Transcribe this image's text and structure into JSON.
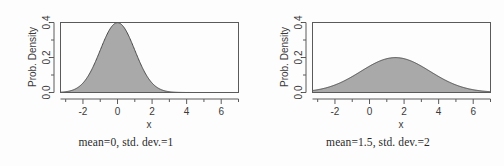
{
  "figure": {
    "background_color": "#fdfdfd",
    "curve_fill_color": "#a9a9a9",
    "curve_line_color": "#4a4a4a",
    "axis_color": "#5a5a5a",
    "text_color": "#3a3a3a"
  },
  "panels": [
    {
      "caption": "mean=0, std. dev.=1",
      "chart_data": {
        "type": "area",
        "title": "",
        "subtitle": "",
        "xlabel": "x",
        "ylabel": "Prob. Density",
        "xlim": [
          -3.3,
          7.0
        ],
        "ylim": [
          0.0,
          0.4
        ],
        "xticks": [
          -2,
          0,
          2,
          4,
          6
        ],
        "xtick_labels": [
          "-2",
          "0",
          "2",
          "4",
          "6"
        ],
        "xticks_minor": [
          -3,
          -1,
          1,
          3,
          5,
          7
        ],
        "yticks": [
          0.0,
          0.2,
          0.4
        ],
        "ytick_labels": [
          "0.0",
          "0.2",
          "0.4"
        ],
        "yticks_minor": [
          0.1,
          0.3
        ],
        "grid": false,
        "legend": "none",
        "distribution": "normal",
        "mean": 0,
        "std_dev": 1,
        "peak_density": 0.3989,
        "series": [
          {
            "name": "Normal(mean=0, sd=1) density",
            "x": [
              -3.3,
              -3.0,
              -2.75,
              -2.5,
              -2.25,
              -2.0,
              -1.75,
              -1.5,
              -1.25,
              -1.0,
              -0.75,
              -0.5,
              -0.25,
              0.0,
              0.25,
              0.5,
              0.75,
              1.0,
              1.25,
              1.5,
              1.75,
              2.0,
              2.25,
              2.5,
              2.75,
              3.0,
              3.25,
              3.5,
              4.0,
              4.5,
              5.0,
              5.5,
              6.0,
              6.5,
              7.0
            ],
            "values": [
              0.0017,
              0.0044,
              0.0091,
              0.0175,
              0.0317,
              0.054,
              0.0863,
              0.1295,
              0.1826,
              0.242,
              0.3011,
              0.3521,
              0.3867,
              0.3989,
              0.3867,
              0.3521,
              0.3011,
              0.242,
              0.1826,
              0.1295,
              0.0863,
              0.054,
              0.0317,
              0.0175,
              0.0091,
              0.0044,
              0.002,
              0.0009,
              0.0001,
              0.0,
              0.0,
              0.0,
              0.0,
              0.0,
              0.0
            ]
          }
        ]
      }
    },
    {
      "caption": "mean=1.5, std. dev.=2",
      "chart_data": {
        "type": "area",
        "title": "",
        "subtitle": "",
        "xlabel": "x",
        "ylabel": "Prob. Density",
        "xlim": [
          -3.3,
          7.0
        ],
        "ylim": [
          0.0,
          0.4
        ],
        "xticks": [
          -2,
          0,
          2,
          4,
          6
        ],
        "xtick_labels": [
          "-2",
          "0",
          "2",
          "4",
          "6"
        ],
        "xticks_minor": [
          -3,
          -1,
          1,
          3,
          5,
          7
        ],
        "yticks": [
          0.0,
          0.2,
          0.4
        ],
        "ytick_labels": [
          "0.0",
          "0.2",
          "0.4"
        ],
        "yticks_minor": [
          0.1,
          0.3
        ],
        "grid": false,
        "legend": "none",
        "distribution": "normal",
        "mean": 1.5,
        "std_dev": 2,
        "peak_density": 0.1995,
        "series": [
          {
            "name": "Normal(mean=1.5, sd=2) density",
            "x": [
              -3.3,
              -3.0,
              -2.5,
              -2.0,
              -1.5,
              -1.0,
              -0.5,
              0.0,
              0.5,
              1.0,
              1.5,
              2.0,
              2.5,
              3.0,
              3.5,
              4.0,
              4.5,
              5.0,
              5.5,
              6.0,
              6.5,
              7.0
            ],
            "values": [
              0.0146,
              0.0175,
              0.0228,
              0.029,
              0.0363,
              0.0444,
              0.0532,
              0.0624,
              0.0713,
              0.0796,
              0.0866,
              0.0919,
              0.095,
              0.0957,
              0.095,
              0.0919,
              0.0866,
              0.0796,
              0.0713,
              0.0624,
              0.0532,
              0.0444
            ]
          }
        ]
      }
    }
  ]
}
